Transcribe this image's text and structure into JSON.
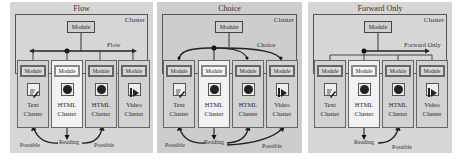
{
  "panels": [
    {
      "title": "Flow",
      "cluster_label": "Cluster",
      "top_module": "Module",
      "nav_label": "Flow",
      "columns": [
        {
          "module": "Module",
          "icon": "text-edit-icon",
          "line1": "Text",
          "line2": "Cluster",
          "highlighted": false
        },
        {
          "module": "Module",
          "icon": "html-globe-icon",
          "line1": "HTML",
          "line2": "Cluster",
          "highlighted": true
        },
        {
          "module": "Module",
          "icon": "html-globe-icon",
          "line1": "HTML",
          "line2": "Cluster",
          "highlighted": false
        },
        {
          "module": "Module",
          "icon": "video-play-icon",
          "line1": "Video",
          "line2": "Cluster",
          "highlighted": false
        }
      ],
      "bottom": {
        "left": "Possible",
        "center": "Reading",
        "right": "Possible"
      }
    },
    {
      "title": "Choice",
      "cluster_label": "Cluster",
      "top_module": "Module",
      "nav_label": "Choice",
      "columns": [
        {
          "module": "Module",
          "icon": "text-edit-icon",
          "line1": "Text",
          "line2": "Cluster",
          "highlighted": false
        },
        {
          "module": "Module",
          "icon": "html-globe-icon",
          "line1": "HTML",
          "line2": "Cluster",
          "highlighted": true
        },
        {
          "module": "Module",
          "icon": "html-globe-icon",
          "line1": "HTML",
          "line2": "Cluster",
          "highlighted": false
        },
        {
          "module": "Module",
          "icon": "video-play-icon",
          "line1": "Video",
          "line2": "Cluster",
          "highlighted": false
        }
      ],
      "bottom": {
        "left": "Possible",
        "center": "Reading",
        "right": "Possible"
      }
    },
    {
      "title": "Forward Only",
      "cluster_label": "Cluster",
      "top_module": "Module",
      "nav_label": "Forward Only",
      "columns": [
        {
          "module": "Module",
          "icon": "text-edit-icon",
          "line1": "Text",
          "line2": "Cluster",
          "highlighted": false
        },
        {
          "module": "Module",
          "icon": "html-globe-icon",
          "line1": "HTML",
          "line2": "Cluster",
          "highlighted": true
        },
        {
          "module": "Module",
          "icon": "html-globe-icon",
          "line1": "HTML",
          "line2": "Cluster",
          "highlighted": false
        },
        {
          "module": "Module",
          "icon": "video-play-icon",
          "line1": "Video",
          "line2": "Cluster",
          "highlighted": false
        }
      ],
      "bottom": {
        "center": "Reading",
        "right": "Possible"
      }
    }
  ]
}
